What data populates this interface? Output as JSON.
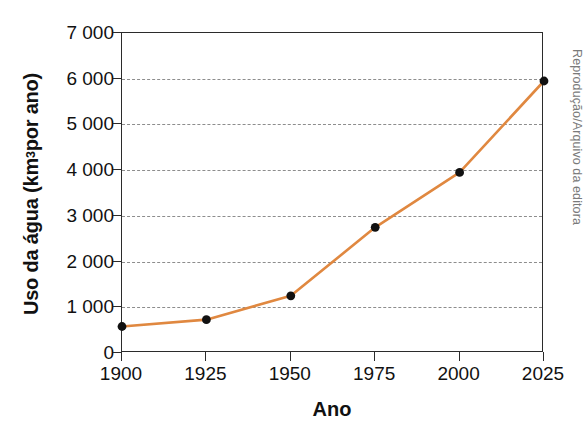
{
  "chart_data": {
    "type": "line",
    "title": "",
    "xlabel": "Ano",
    "ylabel": "Uso da água (km³ por ano)",
    "ylabel_prefix": "Uso da água (km",
    "ylabel_superscript": "3",
    "ylabel_suffix": " por ano)",
    "x": [
      1900,
      1925,
      1950,
      1975,
      2000,
      2025
    ],
    "values": [
      580,
      730,
      1250,
      2750,
      3950,
      5950
    ],
    "series": [
      {
        "name": "Uso da água",
        "values": [
          580,
          730,
          1250,
          2750,
          3950,
          5950
        ]
      }
    ],
    "xtick_labels": [
      "1900",
      "1925",
      "1950",
      "1975",
      "2000",
      "2025"
    ],
    "ytick_labels": [
      "0",
      "1 000",
      "2 000",
      "3 000",
      "4 000",
      "5 000",
      "6 000",
      "7 000"
    ],
    "ytick_values": [
      0,
      1000,
      2000,
      3000,
      4000,
      5000,
      6000,
      7000
    ],
    "xlim": [
      1900,
      2025
    ],
    "ylim": [
      0,
      7000
    ],
    "grid": "horizontal-dashed",
    "legend": "none",
    "line_color": "#E08840",
    "marker_color": "#111111",
    "gridline_color": "#8d8d8d",
    "axis_color": "#2b2b2b"
  },
  "credit": {
    "text": "Reprodução/Arquivo da editora",
    "color": "#7a7a7a"
  }
}
